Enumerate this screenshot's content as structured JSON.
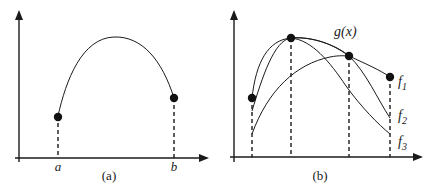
{
  "panel_a": {
    "caption": "(a)",
    "x_labels": {
      "a": "a",
      "b": "b"
    },
    "endpoints": [
      {
        "name": "left-endpoint",
        "x": 58,
        "y": 116
      },
      {
        "name": "right-endpoint",
        "x": 174,
        "y": 98
      }
    ]
  },
  "panel_b": {
    "caption": "(b)",
    "curve_labels": {
      "g": "g(x)",
      "f1_base": "f",
      "f1_sub": "1",
      "f2_base": "f",
      "f2_sub": "2",
      "f3_base": "f",
      "f3_sub": "3"
    },
    "points": [
      {
        "x": 252,
        "y": 98
      },
      {
        "x": 291,
        "y": 38
      },
      {
        "x": 349,
        "y": 56
      },
      {
        "x": 390,
        "y": 77
      }
    ]
  },
  "colors": {
    "ink": "#1a1a1a",
    "background": "#ffffff"
  }
}
